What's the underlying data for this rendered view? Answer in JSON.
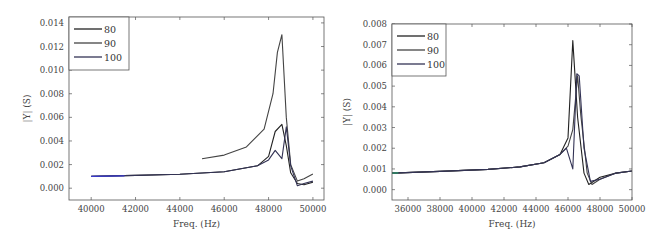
{
  "chart_data": [
    {
      "type": "line",
      "title": "",
      "xlabel": "Freq. (Hz)",
      "ylabel": "|Y| (S)",
      "xlim": [
        39000,
        50500
      ],
      "ylim": [
        -0.001,
        0.0145
      ],
      "xticks": [
        40000,
        42000,
        44000,
        46000,
        48000,
        50000
      ],
      "xtick_labels": [
        "40000",
        "42000",
        "44000",
        "46000",
        "48000",
        "50000"
      ],
      "yticks": [
        0.0,
        0.002,
        0.004,
        0.006,
        0.008,
        0.01,
        0.012,
        0.014
      ],
      "ytick_labels": [
        "0.000",
        "0.002",
        "0.004",
        "0.006",
        "0.008",
        "0.010",
        "0.012",
        "0.014"
      ],
      "grid": false,
      "legend_position": "upper left",
      "series": [
        {
          "name": "80",
          "color": "#222222",
          "x": [
            40000,
            42000,
            44000,
            46000,
            47500,
            48000,
            48300,
            48600,
            48800,
            49000,
            49300,
            49600,
            50000
          ],
          "y": [
            0.001,
            0.00108,
            0.00118,
            0.0014,
            0.0019,
            0.0027,
            0.0048,
            0.0054,
            0.0036,
            0.0013,
            0.0004,
            0.0003,
            0.0005
          ]
        },
        {
          "name": "90",
          "color": "#444444",
          "x": [
            45000,
            46000,
            47000,
            47800,
            48200,
            48400,
            48600,
            48800,
            49000,
            49300,
            49600,
            50000
          ],
          "y": [
            0.0025,
            0.0028,
            0.0035,
            0.005,
            0.008,
            0.0115,
            0.013,
            0.006,
            0.002,
            0.0006,
            0.0008,
            0.0012
          ]
        },
        {
          "name": "100",
          "color": "#333355",
          "x": [
            40000,
            42000,
            44000,
            46000,
            47500,
            48000,
            48300,
            48600,
            48800,
            49000,
            49300,
            49600,
            50000
          ],
          "y": [
            0.001,
            0.00108,
            0.00118,
            0.0014,
            0.0019,
            0.0024,
            0.0032,
            0.0025,
            0.0052,
            0.0019,
            0.0002,
            0.0004,
            0.0006
          ]
        }
      ]
    },
    {
      "type": "line",
      "title": "",
      "xlabel": "Freq. (Hz)",
      "ylabel": "|Y| (S)",
      "xlim": [
        35000,
        50000
      ],
      "ylim": [
        -0.0005,
        0.008
      ],
      "xticks": [
        36000,
        38000,
        40000,
        42000,
        44000,
        46000,
        48000,
        50000
      ],
      "xtick_labels": [
        "36000",
        "38000",
        "40000",
        "42000",
        "44000",
        "46000",
        "48000",
        "50000"
      ],
      "yticks": [
        0.0,
        0.001,
        0.002,
        0.003,
        0.004,
        0.005,
        0.006,
        0.007,
        0.008
      ],
      "ytick_labels": [
        "0.000",
        "0.001",
        "0.002",
        "0.003",
        "0.004",
        "0.005",
        "0.006",
        "0.007",
        "0.008"
      ],
      "grid": false,
      "legend_position": "upper left",
      "series": [
        {
          "name": "80",
          "color": "#222222",
          "x": [
            35000,
            38000,
            41000,
            43000,
            44500,
            45500,
            46000,
            46300,
            46600,
            47000,
            47300,
            48000,
            49000,
            50000
          ],
          "y": [
            0.0008,
            0.00088,
            0.00098,
            0.0011,
            0.0013,
            0.0017,
            0.0025,
            0.0072,
            0.0035,
            0.0008,
            0.00025,
            0.0006,
            0.0008,
            0.0009
          ]
        },
        {
          "name": "90",
          "color": "#444444",
          "x": [
            35000,
            38000,
            41000,
            43000,
            44500,
            45500,
            46000,
            46300,
            46600,
            46800,
            47200,
            47500,
            48000,
            49000,
            50000
          ],
          "y": [
            0.0008,
            0.00088,
            0.00098,
            0.0011,
            0.0013,
            0.0017,
            0.0021,
            0.0029,
            0.0055,
            0.0036,
            0.0008,
            0.00025,
            0.0005,
            0.0008,
            0.0009
          ]
        },
        {
          "name": "100",
          "color": "#333355",
          "x": [
            35000,
            38000,
            41000,
            43000,
            44500,
            45500,
            45900,
            46300,
            46550,
            46700,
            47000,
            47400,
            48000,
            49000,
            50000
          ],
          "y": [
            0.0008,
            0.00088,
            0.00098,
            0.0011,
            0.0013,
            0.0017,
            0.002,
            0.001,
            0.0056,
            0.0055,
            0.002,
            0.0004,
            0.0005,
            0.0008,
            0.0009
          ]
        }
      ]
    }
  ]
}
